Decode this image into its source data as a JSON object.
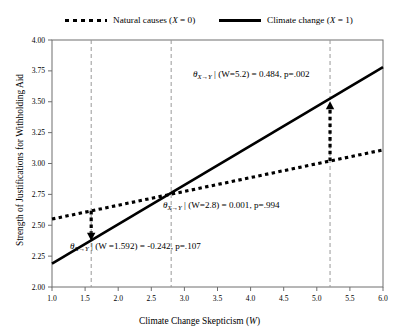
{
  "legend": {
    "items": [
      {
        "id": "natural-causes",
        "label": "Natural causes (X = 0)",
        "style": "dotted",
        "text_plain": "Natural causes (X = 0)"
      },
      {
        "id": "climate-change",
        "label": "Climate change (X = 1)",
        "style": "solid",
        "text_plain": "Climate change (X = 1)"
      }
    ],
    "natural_label_pre": "Natural causes (",
    "natural_label_var": "X",
    "natural_label_post": " = 0)",
    "climate_label_pre": "Climate change (",
    "climate_label_var": "X",
    "climate_label_post": " = 1)"
  },
  "axes": {
    "x_title_pre": "Climate Change Skepticism (",
    "x_title_var": "W",
    "x_title_post": ")",
    "x_title_full": "Climate Change Skepticism (W)",
    "y_title": "Strength of Justifications for Withholding Aid",
    "x_ticks": [
      "1.0",
      "1.5",
      "2.0",
      "2.5",
      "3.0",
      "3.5",
      "4.0",
      "4.5",
      "5.0",
      "5.5",
      "6.0"
    ],
    "y_ticks": [
      "2.00",
      "2.25",
      "2.50",
      "2.75",
      "3.00",
      "3.25",
      "3.50",
      "3.75",
      "4.00"
    ]
  },
  "annotations": [
    {
      "id": "annot-w52",
      "theta": "θ",
      "sub": "X→Y",
      "body": "| (W=5.2) = 0.484, p=.002",
      "w": 5.2,
      "effect": 0.484,
      "p": ".002",
      "full": "θ X→Y | (W=5.2) = 0.484, p=.002"
    },
    {
      "id": "annot-w28",
      "theta": "θ",
      "sub": "X→Y",
      "body": "| (W=2.8) = 0.001, p=.994",
      "w": 2.8,
      "effect": 0.001,
      "p": ".994",
      "full": "θ X→Y | (W=2.8) = 0.001, p=.994"
    },
    {
      "id": "annot-w1592",
      "theta": "θ",
      "sub": "X→Y",
      "body": "| (W =1.592) = -0.242, p=.107",
      "w": 1.592,
      "effect": -0.242,
      "p": ".107",
      "full": "θ X→Y | (W =1.592) = -0.242, p=.107"
    }
  ],
  "chart_data": {
    "type": "line",
    "title": "",
    "xlabel": "Climate Change Skepticism (W)",
    "ylabel": "Strength of Justifications for Withholding Aid",
    "xlim": [
      1.0,
      6.0
    ],
    "ylim": [
      2.0,
      4.0
    ],
    "xticks": [
      1.0,
      1.5,
      2.0,
      2.5,
      3.0,
      3.5,
      4.0,
      4.5,
      5.0,
      5.5,
      6.0
    ],
    "yticks": [
      2.0,
      2.25,
      2.5,
      2.75,
      3.0,
      3.25,
      3.5,
      3.75,
      4.0
    ],
    "grid": false,
    "legend_position": "above-top",
    "series": [
      {
        "name": "Natural causes (X = 0)",
        "style": "dotted",
        "color": "#000000",
        "x": [
          1.0,
          6.0
        ],
        "y": [
          2.55,
          3.11
        ]
      },
      {
        "name": "Climate change (X = 1)",
        "style": "solid",
        "color": "#000000",
        "x": [
          1.0,
          6.0
        ],
        "y": [
          2.19,
          3.78
        ]
      }
    ],
    "vertical_reference_lines": [
      {
        "x": 1.592,
        "style": "dashed",
        "color": "#999999",
        "label": "W=1.592"
      },
      {
        "x": 2.8,
        "style": "dashed",
        "color": "#999999",
        "label": "W=2.8"
      },
      {
        "x": 5.2,
        "style": "dashed",
        "color": "#999999",
        "label": "W=5.2"
      }
    ],
    "effect_arrows": [
      {
        "x": 1.592,
        "from_y": 2.617,
        "to_y": 2.375,
        "direction": "down",
        "effect": -0.242,
        "p": ".107"
      },
      {
        "x": 5.2,
        "from_y": 3.02,
        "to_y": 3.504,
        "direction": "up",
        "effect": 0.484,
        "p": ".002"
      }
    ],
    "crossing_point": {
      "x": 2.8,
      "y": 2.78,
      "effect": 0.001,
      "p": ".994"
    }
  },
  "colors": {
    "line": "#000000",
    "gridline": "#9a9a9a",
    "axis": "#6e6e6e",
    "background": "#ffffff"
  }
}
